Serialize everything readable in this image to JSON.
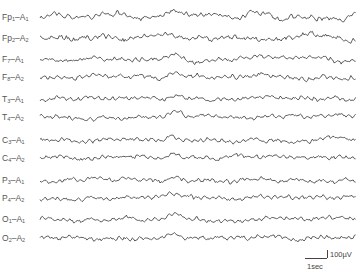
{
  "chart_data": {
    "type": "line",
    "title": "",
    "xlabel": "",
    "ylabel": "",
    "grid": false,
    "legend": "none",
    "channels": [
      {
        "name": "Fp1-A1",
        "base": "Fp",
        "sub1": "1",
        "ref": "A",
        "sub2": "1",
        "y": 17
      },
      {
        "name": "Fp2-A2",
        "base": "Fp",
        "sub1": "2",
        "ref": "A",
        "sub2": "2",
        "y": 38
      },
      {
        "name": "F7-A1",
        "base": "F",
        "sub1": "7",
        "ref": "A",
        "sub2": "1",
        "y": 59
      },
      {
        "name": "F8-A2",
        "base": "F",
        "sub1": "8",
        "ref": "A",
        "sub2": "2",
        "y": 77
      },
      {
        "name": "T3-A1",
        "base": "T",
        "sub1": "3",
        "ref": "A",
        "sub2": "1",
        "y": 99
      },
      {
        "name": "T4-A2",
        "base": "T",
        "sub1": "4",
        "ref": "A",
        "sub2": "2",
        "y": 117
      },
      {
        "name": "C3-A1",
        "base": "C",
        "sub1": "3",
        "ref": "A",
        "sub2": "1",
        "y": 140
      },
      {
        "name": "C4-A2",
        "base": "C",
        "sub1": "4",
        "ref": "A",
        "sub2": "2",
        "y": 158
      },
      {
        "name": "P3-A1",
        "base": "P",
        "sub1": "3",
        "ref": "A",
        "sub2": "1",
        "y": 180
      },
      {
        "name": "P4-A2",
        "base": "P",
        "sub1": "4",
        "ref": "A",
        "sub2": "2",
        "y": 198
      },
      {
        "name": "O1-A1",
        "base": "O",
        "sub1": "1",
        "ref": "A",
        "sub2": "1",
        "y": 219
      },
      {
        "name": "O2-A2",
        "base": "O",
        "sub1": "2",
        "ref": "A",
        "sub2": "2",
        "y": 238
      }
    ],
    "trace_x_range": [
      40,
      356
    ],
    "scale_bar": {
      "amplitude": "100µV",
      "time": "1sec"
    },
    "trace_color": "#333333"
  },
  "labels": {
    "scale_amplitude": "100µV",
    "scale_time": "1sec"
  }
}
